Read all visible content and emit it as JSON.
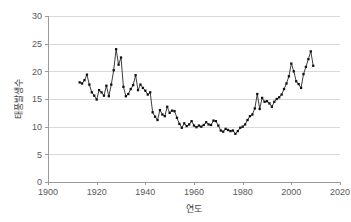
{
  "chart_data": {
    "type": "line",
    "title": "",
    "subtitle": "",
    "xlabel": "연도",
    "ylabel": "태풍발생수",
    "xlim": [
      1900,
      2020
    ],
    "ylim": [
      0,
      30
    ],
    "xticks": [
      1900,
      1920,
      1940,
      1960,
      1980,
      2000,
      2020
    ],
    "yticks": [
      0,
      5,
      10,
      15,
      20,
      25,
      30
    ],
    "grid": "horizontal",
    "legend": "none",
    "markers": true,
    "line_color": "#1a1a1a",
    "marker_color": "#111111",
    "grid_color": "#d9d9d9",
    "axis_color": "#9a9a9a",
    "series": [
      {
        "name": "태풍발생수",
        "x": [
          1913,
          1914,
          1915,
          1916,
          1917,
          1918,
          1919,
          1920,
          1921,
          1922,
          1923,
          1924,
          1925,
          1926,
          1927,
          1928,
          1929,
          1930,
          1931,
          1932,
          1933,
          1934,
          1935,
          1936,
          1937,
          1938,
          1939,
          1940,
          1941,
          1942,
          1943,
          1944,
          1945,
          1946,
          1947,
          1948,
          1949,
          1950,
          1951,
          1952,
          1953,
          1954,
          1955,
          1956,
          1957,
          1958,
          1959,
          1960,
          1961,
          1962,
          1963,
          1964,
          1965,
          1966,
          1967,
          1968,
          1969,
          1970,
          1971,
          1972,
          1973,
          1974,
          1975,
          1976,
          1977,
          1978,
          1979,
          1980,
          1981,
          1982,
          1983,
          1984,
          1985,
          1986,
          1987,
          1988,
          1989,
          1990,
          1991,
          1992,
          1993,
          1994,
          1995,
          1996,
          1997,
          1998,
          1999,
          2000,
          2001,
          2002,
          2003,
          2004,
          2005,
          2006,
          2007,
          2008,
          2009
        ],
        "values": [
          18.0,
          17.8,
          18.4,
          19.4,
          17.6,
          16.2,
          15.6,
          14.9,
          16.6,
          16.2,
          15.6,
          17.4,
          15.5,
          17.6,
          20.2,
          24.0,
          21.2,
          22.5,
          17.2,
          15.5,
          15.9,
          16.8,
          17.5,
          19.3,
          16.6,
          17.6,
          17.0,
          16.5,
          15.8,
          16.2,
          12.6,
          11.8,
          11.2,
          13.0,
          12.2,
          11.9,
          13.6,
          12.5,
          12.9,
          12.8,
          11.6,
          10.5,
          9.8,
          10.6,
          10.1,
          10.4,
          11.0,
          10.2,
          9.9,
          10.2,
          10.0,
          10.3,
          10.8,
          10.4,
          10.3,
          11.1,
          11.0,
          10.2,
          9.3,
          9.1,
          9.6,
          9.4,
          9.2,
          9.3,
          8.7,
          9.2,
          9.8,
          10.0,
          10.4,
          11.2,
          11.9,
          12.2,
          13.3,
          15.9,
          13.2,
          15.2,
          14.5,
          14.6,
          14.2,
          13.6,
          14.5,
          15.0,
          15.3,
          15.8,
          16.8,
          17.8,
          19.1,
          21.4,
          20.0,
          18.2,
          17.7,
          17.0,
          19.5,
          20.8,
          22.2,
          23.6,
          21.0
        ]
      }
    ]
  }
}
